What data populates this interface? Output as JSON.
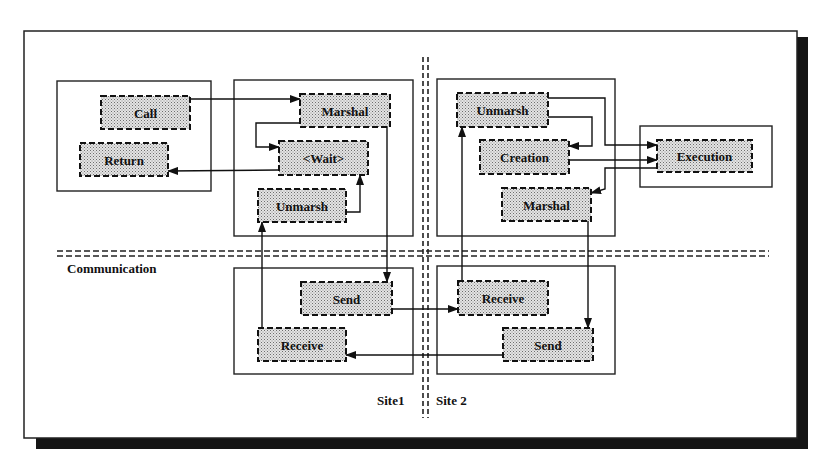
{
  "diagram": {
    "title": "",
    "frame": {
      "x": 23,
      "y": 30,
      "w": 363,
      "h": 177
    },
    "site_labels": {
      "site1": "Site1",
      "site2": "Site 2"
    },
    "section_labels": {
      "communication": "Communication"
    },
    "containers": [
      {
        "id": "client-box",
        "x": 57,
        "y": 81,
        "w": 154,
        "h": 110
      },
      {
        "id": "site1-stub-box",
        "x": 234,
        "y": 80,
        "w": 179,
        "h": 156
      },
      {
        "id": "site2-skeleton-box",
        "x": 437,
        "y": 79,
        "w": 178,
        "h": 157
      },
      {
        "id": "server-box",
        "x": 640,
        "y": 126,
        "w": 132,
        "h": 61
      },
      {
        "id": "site1-comm-box",
        "x": 234,
        "y": 268,
        "w": 179,
        "h": 106
      },
      {
        "id": "site2-comm-box",
        "x": 437,
        "y": 266,
        "w": 178,
        "h": 108
      }
    ],
    "nodes": [
      {
        "id": "call",
        "label": "Call",
        "x": 101,
        "y": 96,
        "w": 89,
        "h": 33
      },
      {
        "id": "return",
        "label": "Return",
        "x": 80,
        "y": 143,
        "w": 88,
        "h": 33
      },
      {
        "id": "marshal1",
        "label": "Marshal",
        "x": 300,
        "y": 94,
        "w": 90,
        "h": 33
      },
      {
        "id": "wait",
        "label": "<Wait>",
        "x": 279,
        "y": 141,
        "w": 89,
        "h": 34
      },
      {
        "id": "unmarsh1",
        "label": "Unmarsh",
        "x": 258,
        "y": 189,
        "w": 88,
        "h": 33
      },
      {
        "id": "unmarsh2",
        "label": "Unmarsh",
        "x": 457,
        "y": 93,
        "w": 91,
        "h": 34
      },
      {
        "id": "creation",
        "label": "Creation",
        "x": 480,
        "y": 140,
        "w": 89,
        "h": 34
      },
      {
        "id": "marshal2",
        "label": "Marshal",
        "x": 502,
        "y": 188,
        "w": 89,
        "h": 33
      },
      {
        "id": "execution",
        "label": "Execution",
        "x": 657,
        "y": 140,
        "w": 95,
        "h": 32
      },
      {
        "id": "send1",
        "label": "Send",
        "x": 301,
        "y": 282,
        "w": 91,
        "h": 33
      },
      {
        "id": "receive1",
        "label": "Receive",
        "x": 258,
        "y": 328,
        "w": 88,
        "h": 33
      },
      {
        "id": "receive2",
        "label": "Receive",
        "x": 458,
        "y": 281,
        "w": 90,
        "h": 34
      },
      {
        "id": "send2",
        "label": "Send",
        "x": 503,
        "y": 328,
        "w": 90,
        "h": 33
      }
    ],
    "edges": [
      {
        "from": "call",
        "to": "marshal1"
      },
      {
        "from": "marshal1",
        "to": "wait"
      },
      {
        "from": "wait",
        "to": "return"
      },
      {
        "from": "unmarsh1",
        "to": "wait"
      },
      {
        "from": "marshal1",
        "to": "send1"
      },
      {
        "from": "send1",
        "to": "receive2"
      },
      {
        "from": "receive2",
        "to": "unmarsh2"
      },
      {
        "from": "unmarsh2",
        "to": "creation"
      },
      {
        "from": "unmarsh2",
        "to": "execution"
      },
      {
        "from": "creation",
        "to": "execution"
      },
      {
        "from": "execution",
        "to": "marshal2"
      },
      {
        "from": "marshal2",
        "to": "send2"
      },
      {
        "from": "send2",
        "to": "receive1"
      },
      {
        "from": "receive1",
        "to": "unmarsh1"
      }
    ]
  }
}
